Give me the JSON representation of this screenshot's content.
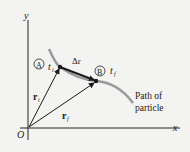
{
  "diagram": {
    "axes": {
      "x_label": "x",
      "y_label": "y",
      "origin_label": "O"
    },
    "points": [
      {
        "marker": "A",
        "time_label": "t",
        "time_sub": "i"
      },
      {
        "marker": "B",
        "time_label": "t",
        "time_sub": "f"
      }
    ],
    "vectors": {
      "initial": {
        "label": "r",
        "sub": "i"
      },
      "final": {
        "label": "r",
        "sub": "f"
      },
      "displacement": {
        "label": "Δr"
      }
    },
    "path_label_line1": "Path of",
    "path_label_line2": "particle",
    "colors": {
      "background": "#f3f3f1",
      "path": "#999999",
      "ink": "#1a1a1a"
    }
  }
}
